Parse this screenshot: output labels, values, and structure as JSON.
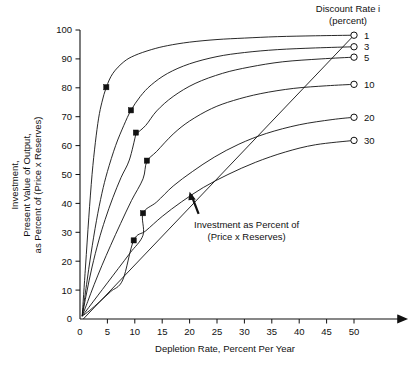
{
  "chart_data": {
    "type": "line",
    "title": "",
    "xlabel": "Depletion Rate, Percent Per Year",
    "ylabel_lines": [
      "Investment,",
      "Present Value of Output,",
      "as Percent of (Price x Reserves)"
    ],
    "xlim": [
      0,
      55
    ],
    "ylim": [
      0,
      100
    ],
    "xticks": [
      0,
      5,
      10,
      15,
      20,
      25,
      30,
      35,
      40,
      45,
      50
    ],
    "yticks": [
      0,
      10,
      20,
      30,
      40,
      50,
      60,
      70,
      80,
      90,
      100
    ],
    "grid": false,
    "legend_title_lines": [
      "Discount Rate i",
      "(percent)"
    ],
    "legend_position": "right",
    "annotations": [
      {
        "text_lines": [
          "Investment as Percent of",
          "(Price x Reserves)"
        ],
        "target_x": 20.0,
        "target_y": 44.0
      }
    ],
    "series": [
      {
        "name": "1",
        "label": "1",
        "end_marker": "open-circle",
        "points": [
          [
            0.4,
            1.0
          ],
          [
            1.0,
            18.0
          ],
          [
            1.6,
            35.0
          ],
          [
            2.2,
            50.0
          ],
          [
            2.8,
            61.0
          ],
          [
            3.4,
            69.5
          ],
          [
            4.0,
            75.0
          ],
          [
            4.8,
            80.2
          ],
          [
            6.0,
            85.0
          ],
          [
            8.0,
            89.0
          ],
          [
            10.0,
            91.2
          ],
          [
            13.0,
            93.2
          ],
          [
            16.0,
            94.6
          ],
          [
            20.0,
            95.8
          ],
          [
            25.0,
            96.7
          ],
          [
            30.0,
            97.2
          ],
          [
            36.0,
            97.7
          ],
          [
            43.0,
            98.0
          ],
          [
            50.0,
            98.2
          ]
        ],
        "data_point": [
          4.8,
          80.2
        ]
      },
      {
        "name": "3",
        "label": "3",
        "end_marker": "open-circle",
        "points": [
          [
            0.4,
            1.0
          ],
          [
            1.2,
            12.0
          ],
          [
            2.0,
            22.5
          ],
          [
            3.0,
            34.0
          ],
          [
            4.0,
            43.5
          ],
          [
            5.0,
            51.0
          ],
          [
            6.5,
            60.0
          ],
          [
            8.0,
            67.0
          ],
          [
            9.3,
            72.2
          ],
          [
            11.0,
            77.0
          ],
          [
            13.0,
            81.0
          ],
          [
            16.0,
            85.0
          ],
          [
            20.0,
            88.3
          ],
          [
            25.0,
            90.8
          ],
          [
            30.0,
            92.2
          ],
          [
            36.0,
            93.2
          ],
          [
            43.0,
            93.8
          ],
          [
            50.0,
            94.2
          ]
        ],
        "data_point": [
          9.3,
          72.2
        ]
      },
      {
        "name": "5",
        "label": "5",
        "end_marker": "open-circle",
        "points": [
          [
            0.4,
            1.0
          ],
          [
            1.2,
            9.0
          ],
          [
            2.2,
            18.0
          ],
          [
            3.4,
            27.0
          ],
          [
            4.6,
            34.5
          ],
          [
            6.0,
            42.0
          ],
          [
            7.5,
            49.0
          ],
          [
            9.0,
            55.0
          ],
          [
            10.2,
            64.0
          ],
          [
            10.2,
            64.0
          ],
          [
            12.0,
            67.0
          ],
          [
            14.0,
            72.0
          ],
          [
            17.0,
            77.0
          ],
          [
            21.0,
            81.5
          ],
          [
            26.0,
            85.0
          ],
          [
            31.0,
            87.2
          ],
          [
            37.0,
            89.0
          ],
          [
            44.0,
            90.0
          ],
          [
            50.0,
            90.6
          ]
        ],
        "data_point": [
          10.2,
          64.5
        ]
      },
      {
        "name": "10",
        "label": "10",
        "end_marker": "open-circle",
        "points": [
          [
            0.4,
            1.0
          ],
          [
            1.4,
            6.0
          ],
          [
            2.6,
            12.0
          ],
          [
            4.0,
            18.5
          ],
          [
            5.6,
            25.5
          ],
          [
            7.4,
            33.0
          ],
          [
            9.4,
            41.0
          ],
          [
            11.5,
            48.5
          ],
          [
            12.2,
            54.5
          ],
          [
            14.0,
            58.0
          ],
          [
            17.0,
            64.0
          ],
          [
            20.0,
            68.5
          ],
          [
            24.0,
            72.8
          ],
          [
            28.0,
            75.6
          ],
          [
            33.0,
            78.0
          ],
          [
            39.0,
            79.8
          ],
          [
            45.0,
            80.7
          ],
          [
            50.0,
            81.2
          ]
        ],
        "data_point": [
          12.2,
          54.8
        ]
      },
      {
        "name": "20",
        "label": "20",
        "end_marker": "open-circle",
        "points": [
          [
            0.4,
            1.0
          ],
          [
            1.6,
            4.0
          ],
          [
            3.2,
            8.0
          ],
          [
            5.0,
            12.5
          ],
          [
            7.0,
            17.5
          ],
          [
            9.2,
            23.0
          ],
          [
            11.5,
            29.0
          ],
          [
            11.5,
            36.6
          ],
          [
            14.0,
            40.5
          ],
          [
            17.0,
            46.0
          ],
          [
            20.5,
            51.0
          ],
          [
            24.5,
            56.0
          ],
          [
            29.0,
            60.5
          ],
          [
            34.0,
            64.2
          ],
          [
            40.0,
            67.2
          ],
          [
            46.0,
            69.0
          ],
          [
            50.0,
            69.8
          ]
        ],
        "data_point": [
          11.5,
          36.6
        ]
      },
      {
        "name": "30",
        "label": "30",
        "end_marker": "open-circle",
        "points": [
          [
            0.4,
            1.0
          ],
          [
            1.8,
            3.0
          ],
          [
            3.6,
            6.0
          ],
          [
            5.6,
            9.5
          ],
          [
            7.8,
            13.5
          ],
          [
            9.8,
            27.2
          ],
          [
            12.0,
            30.5
          ],
          [
            15.0,
            35.5
          ],
          [
            18.5,
            40.5
          ],
          [
            22.5,
            45.5
          ],
          [
            27.0,
            50.0
          ],
          [
            32.0,
            54.2
          ],
          [
            37.5,
            57.8
          ],
          [
            43.0,
            60.3
          ],
          [
            50.0,
            61.8
          ]
        ],
        "data_point": [
          9.8,
          27.2
        ]
      }
    ],
    "investment_line": {
      "name": "Investment as Percent of (Price x Reserves)",
      "type": "straight",
      "points": [
        [
          0.6,
          0.0
        ],
        [
          50.0,
          98.2
        ]
      ]
    }
  }
}
